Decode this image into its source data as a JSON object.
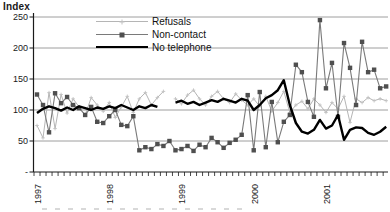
{
  "chart_data": {
    "type": "line",
    "title": "",
    "ylabel": "Index",
    "xlabel": "",
    "ylim": [
      0,
      250
    ],
    "grid": true,
    "legend_position": "top-center",
    "y_ticks": [
      {
        "label": "250",
        "value": 250
      },
      {
        "label": "200",
        "value": 200
      },
      {
        "label": "150",
        "value": 150
      },
      {
        "label": "100",
        "value": 100
      },
      {
        "label": "50",
        "value": 50
      },
      {
        "label": "-",
        "value": 0
      }
    ],
    "x_unit": "month",
    "x_range": [
      "1997-01",
      "2001-11"
    ],
    "x_year_labels": [
      {
        "label": "1997",
        "month_index": 0
      },
      {
        "label": "1998",
        "month_index": 12
      },
      {
        "label": "1999",
        "month_index": 24
      },
      {
        "label": "2000",
        "month_index": 36
      },
      {
        "label": "2001",
        "month_index": 48
      }
    ],
    "series": [
      {
        "name": "Refusals",
        "color": "#b5b5b5",
        "marker": "plus",
        "marker_color": "#c2c2c2",
        "line_width": 1,
        "values": [
          75,
          55,
          128,
          70,
          125,
          95,
          118,
          105,
          92,
          120,
          108,
          98,
          112,
          88,
          105,
          122,
          96,
          118,
          128,
          108,
          120,
          130,
          null,
          118,
          110,
          124,
          132,
          118,
          108,
          122,
          130,
          118,
          112,
          126,
          116,
          108,
          118,
          106,
          122,
          98,
          112,
          130,
          96,
          108,
          114,
          102,
          118,
          108,
          96,
          112,
          102,
          122,
          80,
          118,
          112,
          120,
          115,
          118,
          115
        ]
      },
      {
        "name": "Non-contact",
        "color": "#7a7a7a",
        "marker": "square",
        "marker_color": "#4f4f4f",
        "line_width": 1.1,
        "values": [
          125,
          108,
          64,
          127,
          111,
          121,
          108,
          103,
          92,
          105,
          81,
          79,
          90,
          100,
          76,
          74,
          90,
          35,
          40,
          37,
          45,
          42,
          50,
          35,
          37,
          42,
          34,
          44,
          40,
          55,
          48,
          39,
          47,
          52,
          60,
          124,
          35,
          129,
          40,
          113,
          48,
          81,
          92,
          173,
          161,
          113,
          89,
          245,
          135,
          176,
          89,
          208,
          168,
          108,
          210,
          161,
          165,
          135,
          138
        ]
      },
      {
        "name": "No telephone",
        "color": "#000000",
        "marker": "none",
        "marker_color": "#000000",
        "line_width": 2.4,
        "values": [
          95,
          102,
          106,
          103,
          99,
          104,
          100,
          106,
          103,
          100,
          104,
          102,
          106,
          103,
          108,
          104,
          100,
          106,
          103,
          108,
          105,
          null,
          null,
          112,
          115,
          110,
          113,
          108,
          112,
          116,
          113,
          118,
          115,
          112,
          118,
          115,
          100,
          108,
          119,
          124,
          132,
          148,
          108,
          79,
          65,
          62,
          68,
          84,
          70,
          75,
          92,
          52,
          68,
          72,
          71,
          63,
          60,
          65,
          73
        ]
      }
    ]
  }
}
